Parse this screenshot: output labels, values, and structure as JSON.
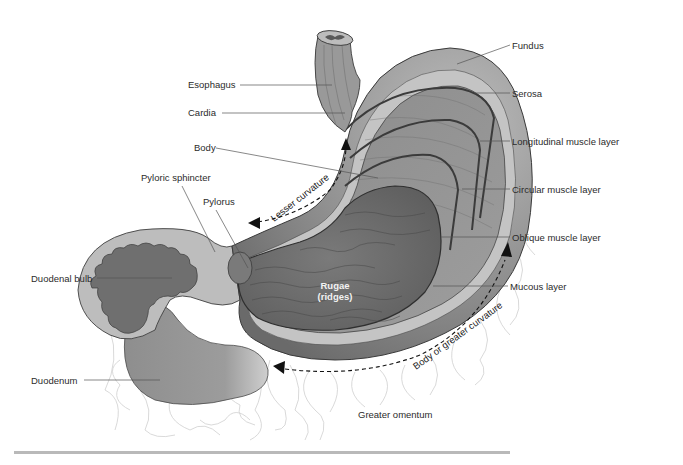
{
  "diagram": {
    "labels": {
      "fundus": "Fundus",
      "esophagus": "Esophagus",
      "serosa": "Serosa",
      "cardia": "Cardia",
      "longitudinal_muscle": "Longitudinal muscle layer",
      "body": "Body",
      "pyloric_sphincter": "Pyloric sphincter",
      "circular_muscle": "Circular muscle layer",
      "pylorus": "Pylorus",
      "oblique_muscle": "Oblique muscle layer",
      "duodenal_bulb": "Duodenal bulb",
      "mucous_layer": "Mucous layer",
      "rugae_line1": "Rugae",
      "rugae_line2": "(ridges)",
      "duodenum": "Duodenum",
      "greater_omentum": "Greater omentum",
      "lesser_curvature": "Lesser curvature",
      "greater_curvature": "Body or greater curvature"
    },
    "colors": {
      "outer_wall": "#9a9a9a",
      "serosa_band": "#c8c8c8",
      "muscle": "#8c8c8c",
      "mucosa": "#6e6e6e",
      "outline": "#3a3a3a",
      "omentum": "#cfcfcf",
      "label_text": "#2b2b2b",
      "leader_line": "#555555"
    }
  }
}
